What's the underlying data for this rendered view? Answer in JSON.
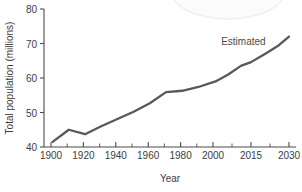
{
  "chart_data": {
    "type": "line",
    "title": "",
    "xlabel": "Year",
    "ylabel": "Total population (millions)",
    "ylim": [
      40,
      80
    ],
    "yticks": [
      40,
      50,
      60,
      70,
      80
    ],
    "ytick_labels": [
      "40",
      "50",
      "60",
      "70",
      "80"
    ],
    "xtick_labels": [
      "1900",
      "1920",
      "1940",
      "1960",
      "1980",
      "2000",
      "2015",
      "2030"
    ],
    "xticks": [
      1900,
      1920,
      1940,
      1960,
      1980,
      2000,
      2015,
      2030
    ],
    "grid": false,
    "legend": false,
    "annotations": [
      {
        "text": "Estimated",
        "x": 2012,
        "y": 70.5
      }
    ],
    "series": [
      {
        "name": "Total population",
        "color": "#585858",
        "x": [
          1901,
          1911,
          1921,
          1931,
          1951,
          1961,
          1971,
          1981,
          1991,
          2001,
          2006,
          2011,
          2015,
          2021,
          2026,
          2030
        ],
        "values": [
          41.5,
          45.0,
          43.7,
          46.0,
          50.2,
          52.7,
          55.9,
          56.3,
          57.4,
          59.0,
          61.0,
          63.5,
          64.6,
          67.2,
          69.5,
          72.0
        ]
      }
    ]
  },
  "axis": {
    "x_title": "Year",
    "y_title": "Total population (millions)"
  },
  "annotation": {
    "estimated_label": "Estimated"
  }
}
